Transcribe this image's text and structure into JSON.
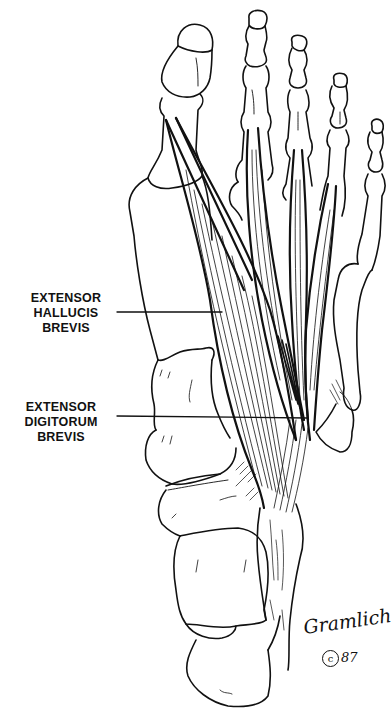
{
  "figure": {
    "style": "black line art on white"
  },
  "labels": [
    {
      "id": "extensor-hallucis-brevis",
      "lines": [
        "EXTENSOR",
        "HALLUCIS BREVIS"
      ]
    },
    {
      "id": "extensor-digitorum-brevis",
      "lines": [
        "EXTENSOR",
        "DIGITORUM BREVIS"
      ]
    }
  ],
  "signature": {
    "name": "Gramlich",
    "copyright_symbol": "c",
    "year": "87"
  },
  "colors": {
    "background": "#ffffff",
    "ink": "#111111"
  }
}
